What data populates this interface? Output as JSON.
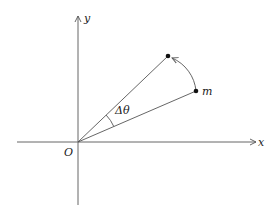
{
  "diagram": {
    "type": "angular-displacement",
    "axes": {
      "x_label": "x",
      "y_label": "y",
      "origin_label": "O",
      "origin_px": [
        78,
        142
      ],
      "x_range_px": [
        17,
        258
      ],
      "y_range_px": [
        205,
        14
      ]
    },
    "points": [
      {
        "name": "initial",
        "label": "m",
        "px": [
          196,
          91
        ]
      },
      {
        "name": "final",
        "label": "",
        "px": [
          168,
          56
        ]
      }
    ],
    "angle_label": "Δθ",
    "colors": {
      "line": "#555555",
      "point": "#111111",
      "text": "#222222"
    }
  }
}
